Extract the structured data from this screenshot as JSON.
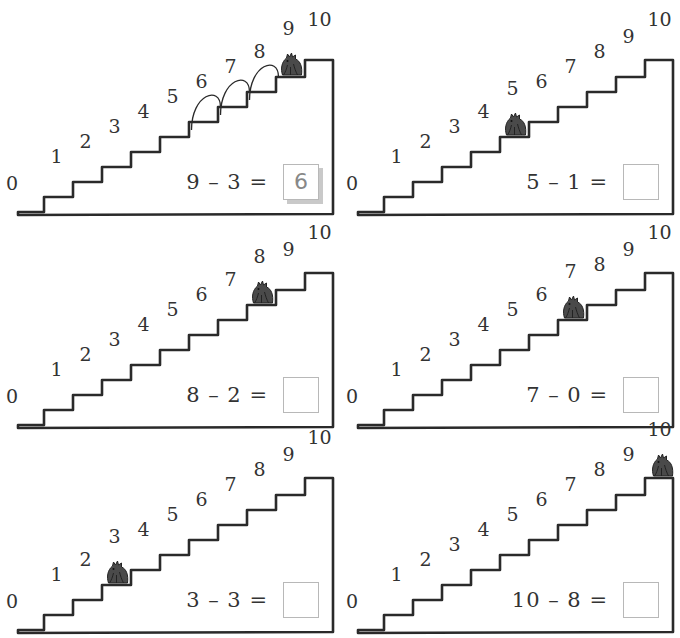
{
  "worksheet": {
    "colors": {
      "ink": "#2a2a2a",
      "creature": "#4a4a4a",
      "box_border": "#b8b8b8",
      "box_shadow": "#c9c9c9"
    },
    "step_labels": [
      "0",
      "1",
      "2",
      "3",
      "4",
      "5",
      "6",
      "7",
      "8",
      "9",
      "10"
    ],
    "panels": [
      {
        "equation": "9 – 3 =",
        "answer": "6",
        "creature_step": 9,
        "hops": 3,
        "filled": true
      },
      {
        "equation": "5 – 1 =",
        "answer": "",
        "creature_step": 5,
        "hops": 0,
        "filled": false
      },
      {
        "equation": "8 – 2 =",
        "answer": "",
        "creature_step": 8,
        "hops": 0,
        "filled": false
      },
      {
        "equation": "7 – 0 =",
        "answer": "",
        "creature_step": 7,
        "hops": 0,
        "filled": false
      },
      {
        "equation": "3 – 3 =",
        "answer": "",
        "creature_step": 3,
        "hops": 0,
        "filled": false
      },
      {
        "equation": "10 – 8 =",
        "answer": "",
        "creature_step": 10,
        "hops": 0,
        "filled": false
      }
    ]
  }
}
